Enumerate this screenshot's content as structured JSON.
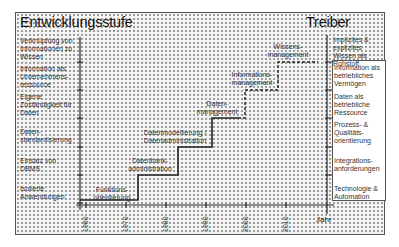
{
  "diagram": {
    "left_title": "Entwicklungsstufe",
    "right_title": "Treiber",
    "x_axis_label": "Jahr",
    "years": [
      "1960",
      "1970",
      "1980",
      "1990",
      "2000",
      "2010"
    ],
    "development_stages": [
      {
        "label": "Verknüpfung von Informationen zu Wissen"
      },
      {
        "label": "Information als Unternehmens-ressource"
      },
      {
        "label": "Eigene Zuständigkeit für Daten"
      },
      {
        "label": "Daten-standardisierung"
      },
      {
        "label": "Einsatz von DBMS"
      },
      {
        "label": "Isolierte Anwendungen"
      }
    ],
    "steps": [
      {
        "label": "Funktions-orientierung",
        "line": "solid"
      },
      {
        "label": "Datenbank-administration",
        "line": "solid"
      },
      {
        "label": "Datenmodellierung / Datenadministration",
        "line": "solid"
      },
      {
        "label": "Daten-management",
        "line": "solid"
      },
      {
        "label": "Informations-management",
        "line": "dashed"
      },
      {
        "label": "Wissens-management",
        "line": "dashed"
      }
    ],
    "drivers": [
      {
        "label": "Implizites & explizites Wissen als Rohstoff"
      },
      {
        "label": "Information als betriebliches Vermögen"
      },
      {
        "label": "Daten als betriebliche Ressource"
      },
      {
        "label": "Prozess- & Qualitäts-orientierung"
      },
      {
        "label": "Integrations-anforderungen"
      },
      {
        "label": "Technologie & Automation"
      }
    ]
  },
  "colors": {
    "frame_border": "#555555",
    "dot_pattern": "#9a9a9a",
    "line": "#222222",
    "text": "#333333"
  }
}
